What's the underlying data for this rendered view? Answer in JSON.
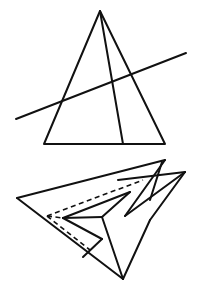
{
  "figure": {
    "width": 200,
    "height": 303,
    "stroke_color": "#111111",
    "background": "#ffffff"
  },
  "top_figure": {
    "description": "Triangle with a cevian from apex and a transversal line",
    "triangle": [
      [
        100,
        11
      ],
      [
        44,
        144
      ],
      [
        165,
        144
      ]
    ],
    "cevian": [
      [
        100,
        11
      ],
      [
        123,
        144
      ]
    ],
    "transversal": [
      [
        16,
        119
      ],
      [
        186,
        53
      ]
    ]
  },
  "bottom_figure": {
    "description": "Folded paper plane-like shape with hidden dashed edges",
    "solid_lines": [
      [
        [
          17,
          198
        ],
        [
          165,
          160
        ]
      ],
      [
        [
          17,
          198
        ],
        [
          123,
          279
        ]
      ],
      [
        [
          165,
          160
        ],
        [
          125,
          216
        ]
      ],
      [
        [
          125,
          216
        ],
        [
          185,
          172
        ]
      ],
      [
        [
          185,
          172
        ],
        [
          150,
          220
        ]
      ],
      [
        [
          150,
          220
        ],
        [
          123,
          279
        ]
      ],
      [
        [
          118,
          180
        ],
        [
          185,
          172
        ]
      ],
      [
        [
          162,
          162
        ],
        [
          150,
          200
        ]
      ],
      [
        [
          63,
          218
        ],
        [
          130,
          192
        ]
      ],
      [
        [
          130,
          192
        ],
        [
          102,
          217
        ]
      ],
      [
        [
          63,
          218
        ],
        [
          102,
          217
        ]
      ],
      [
        [
          102,
          217
        ],
        [
          123,
          279
        ]
      ],
      [
        [
          63,
          218
        ],
        [
          102,
          239
        ]
      ],
      [
        [
          102,
          239
        ],
        [
          83,
          257
        ]
      ]
    ],
    "dashed_lines": [
      [
        [
          47,
          216
        ],
        [
          143,
          180
        ]
      ],
      [
        [
          47,
          216
        ],
        [
          63,
          218
        ]
      ],
      [
        [
          47,
          216
        ],
        [
          90,
          250
        ]
      ]
    ]
  }
}
